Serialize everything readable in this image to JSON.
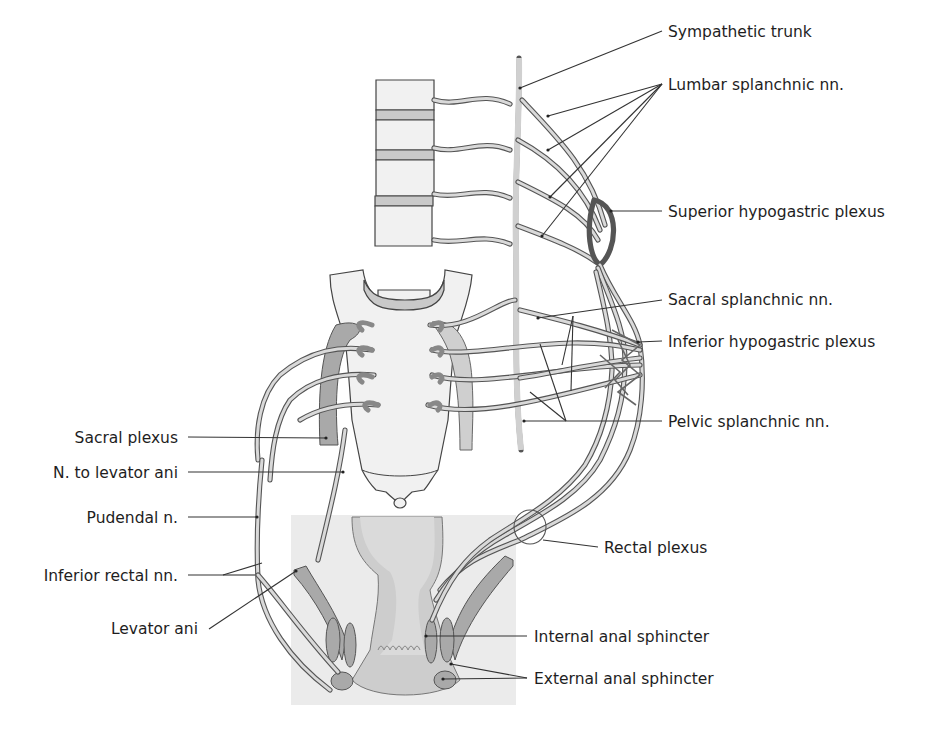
{
  "figure": {
    "colors": {
      "background": "#ffffff",
      "nerve_outline": "#555555",
      "nerve_fill": "#d9d9d9",
      "muscle": "#a9a9a9",
      "bone": "#f1f1f1",
      "text": "#1e1e1e"
    }
  },
  "labels": {
    "right": [
      {
        "id": "sympathetic-trunk",
        "text": "Sympathetic trunk",
        "x": 668,
        "y": 31
      },
      {
        "id": "lumbar-splanchnic",
        "text": "Lumbar splanchnic nn.",
        "x": 668,
        "y": 84
      },
      {
        "id": "superior-hypogastric",
        "text": "Superior hypogastric plexus",
        "x": 668,
        "y": 216
      },
      {
        "id": "sacral-splanchnic",
        "text": "Sacral splanchnic nn.",
        "x": 668,
        "y": 303
      },
      {
        "id": "inferior-hypogastric",
        "text": "Inferior hypogastric plexus",
        "x": 668,
        "y": 345
      },
      {
        "id": "pelvic-splanchnic",
        "text": "Pelvic splanchnic nn.",
        "x": 668,
        "y": 426
      },
      {
        "id": "rectal-plexus",
        "text": "Rectal plexus",
        "x": 604,
        "y": 552
      },
      {
        "id": "internal-anal-sphincter",
        "text": "Internal anal sphincter",
        "x": 534,
        "y": 641
      },
      {
        "id": "external-anal-sphincter",
        "text": "External anal sphincter",
        "x": 534,
        "y": 683
      }
    ],
    "left": [
      {
        "id": "sacral-plexus",
        "text": "Sacral plexus",
        "x": 178,
        "y": 442
      },
      {
        "id": "n-to-levator-ani",
        "text": "N. to levator ani",
        "x": 178,
        "y": 477
      },
      {
        "id": "pudendal-n",
        "text": "Pudendal n.",
        "x": 178,
        "y": 522
      },
      {
        "id": "inferior-rectal-nn",
        "text": "Inferior rectal nn.",
        "x": 178,
        "y": 580
      },
      {
        "id": "levator-ani",
        "text": "Levator ani",
        "x": 198,
        "y": 633
      }
    ]
  }
}
